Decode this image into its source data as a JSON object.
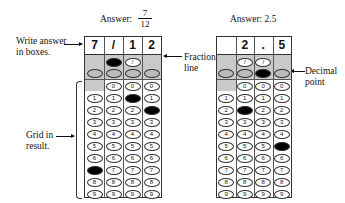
{
  "left": {
    "answer_label": "Answer:",
    "answer_num": "7",
    "answer_den": "12",
    "boxes": [
      "7",
      "/",
      "1",
      "2"
    ],
    "fraction_row": [
      false,
      true,
      "/",
      false
    ],
    "decimal_row": [
      false,
      false,
      false,
      false
    ],
    "filled": [
      7,
      null,
      1,
      2
    ],
    "digits": [
      "0",
      "1",
      "2",
      "3",
      "4",
      "5",
      "6",
      "7",
      "8",
      "9"
    ]
  },
  "right": {
    "answer_label": "Answer: 2.5",
    "boxes": [
      "",
      "2",
      ".",
      "5"
    ],
    "filled": [
      null,
      2,
      null,
      5
    ],
    "decimal_filled_col": 2
  },
  "labels": {
    "write_answer": "Write answer in boxes.",
    "fraction_line": "Fraction line",
    "grid_in": "Grid in result.",
    "decimal_point": "Decimal point"
  }
}
